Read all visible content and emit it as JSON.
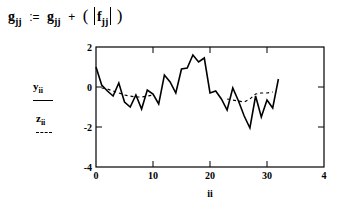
{
  "equation": {
    "lhs": "g",
    "lhs_sub": "jj",
    "assign": ":=",
    "rhs_var": "g",
    "rhs_sub": "jj",
    "plus": "+",
    "open_paren": "(",
    "abs_var": "f",
    "abs_sub": "jj",
    "close_paren": ")"
  },
  "legend": {
    "y_label": "y",
    "y_sub": "ii",
    "z_label": "z",
    "z_sub": "ii",
    "y_style": "solid",
    "z_style": "dashed"
  },
  "chart_data": {
    "type": "line",
    "title": "",
    "xlabel": "ii",
    "ylabel": "",
    "xlim": [
      0,
      40
    ],
    "ylim": [
      -4,
      2
    ],
    "x_ticks": [
      "0",
      "10",
      "20",
      "30",
      "4"
    ],
    "y_ticks": [
      "2",
      "0",
      "-2",
      "-4"
    ],
    "grid": false,
    "x": [
      0,
      1,
      2,
      3,
      4,
      5,
      6,
      7,
      8,
      9,
      10,
      11,
      12,
      13,
      14,
      15,
      16,
      17,
      18,
      19,
      20,
      21,
      22,
      23,
      24,
      25,
      26,
      27,
      28,
      29,
      30,
      31,
      32
    ],
    "series": [
      {
        "name": "y_ii",
        "style": "solid",
        "values": [
          1.0,
          0.1,
          -0.2,
          -0.45,
          0.2,
          -0.75,
          -1.0,
          -0.4,
          -1.1,
          -0.15,
          -0.35,
          -0.85,
          0.6,
          0.25,
          -0.3,
          0.9,
          0.95,
          1.6,
          1.25,
          1.45,
          -0.3,
          -0.2,
          -0.6,
          -1.15,
          -0.05,
          -0.7,
          -1.45,
          -2.05,
          -0.45,
          -1.5,
          -0.65,
          -1.05,
          0.4
        ]
      },
      {
        "name": "z_ii",
        "style": "dashed",
        "values": [
          null,
          -0.05,
          -0.1,
          -0.2,
          -0.3,
          -0.4,
          -0.45,
          -0.5,
          -0.5,
          -0.45,
          -0.4,
          null,
          null,
          null,
          null,
          null,
          null,
          null,
          null,
          null,
          null,
          null,
          null,
          -0.6,
          -0.65,
          -0.7,
          -0.75,
          -0.6,
          -0.35,
          -0.3,
          -0.3,
          -0.25,
          null
        ]
      }
    ]
  }
}
